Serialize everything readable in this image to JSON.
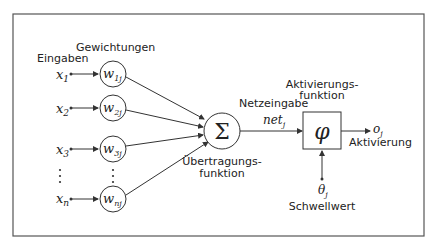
{
  "diagram": {
    "labels": {
      "inputs": "Eingaben",
      "weights": "Gewichtungen",
      "transfer_function": [
        "Übertragungs-",
        "funktion"
      ],
      "net_input": "Netzeingabe",
      "net_symbol": "net",
      "net_sub": "j",
      "activation_function": [
        "Aktivierungs-",
        "funktion"
      ],
      "activation": "Aktivierung",
      "threshold": "Schwellwert"
    },
    "inputs": [
      {
        "sym": "x",
        "sub": "1",
        "weight": "w",
        "wsub": "1j"
      },
      {
        "sym": "x",
        "sub": "2",
        "weight": "w",
        "wsub": "2j"
      },
      {
        "sym": "x",
        "sub": "3",
        "weight": "w",
        "wsub": "3j"
      },
      {
        "sym": "x",
        "sub": "n",
        "weight": "w",
        "wsub": "nj"
      }
    ],
    "sum_symbol": "Σ",
    "phi_symbol": "φ",
    "output": {
      "sym": "o",
      "sub": "j"
    },
    "threshold_symbol": {
      "sym": "θ",
      "sub": "j"
    },
    "colors": {
      "stroke": "#333333",
      "border": "#555555",
      "background": "#ffffff"
    }
  }
}
